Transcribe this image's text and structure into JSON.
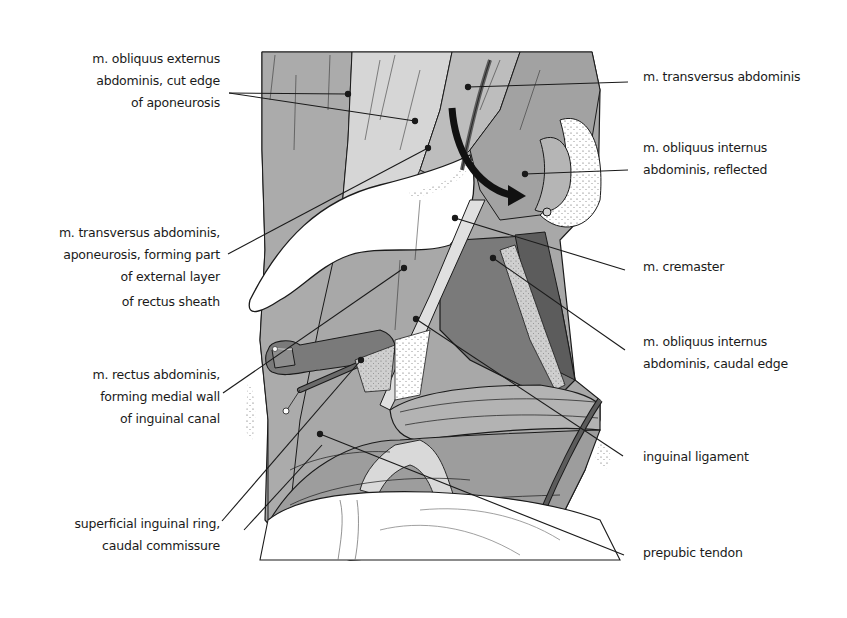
{
  "figure": {
    "type": "anatomical-illustration",
    "colors": {
      "background": "#ffffff",
      "light_tissue": "#d9d9d9",
      "mid_tissue": "#a8a8a8",
      "dark_muscle": "#7a7a7a",
      "darkest_muscle": "#5c5c5c",
      "outline": "#1a1a1a",
      "arrow": "#111111"
    }
  },
  "labels_left": [
    {
      "id": "obliquus-externus",
      "lines": [
        "m. obliquus externus",
        "abdominis,  cut edge",
        "of aponeurosis"
      ]
    },
    {
      "id": "transversus-aponeurosis",
      "lines": [
        "m. transversus abdominis,",
        "aponeurosis,  forming part",
        "of external layer",
        "of rectus sheath"
      ]
    },
    {
      "id": "rectus-abdominis",
      "lines": [
        "m. rectus abdominis,",
        "forming medial wall",
        "of inguinal canal"
      ]
    },
    {
      "id": "superficial-inguinal-ring",
      "lines": [
        "superficial inguinal ring,",
        "caudal commissure"
      ]
    }
  ],
  "labels_right": [
    {
      "id": "transversus-abdominis",
      "lines": [
        "m. transversus abdominis"
      ]
    },
    {
      "id": "obliquus-internus-reflected",
      "lines": [
        "m. obliquus internus",
        "abdominis, reflected"
      ]
    },
    {
      "id": "cremaster",
      "lines": [
        "m. cremaster"
      ]
    },
    {
      "id": "obliquus-internus-caudal",
      "lines": [
        "m. obliquus internus",
        "abdominis, caudal edge"
      ]
    },
    {
      "id": "inguinal-ligament",
      "lines": [
        "inguinal ligament"
      ]
    },
    {
      "id": "prepubic-tendon",
      "lines": [
        "prepubic tendon"
      ]
    }
  ]
}
